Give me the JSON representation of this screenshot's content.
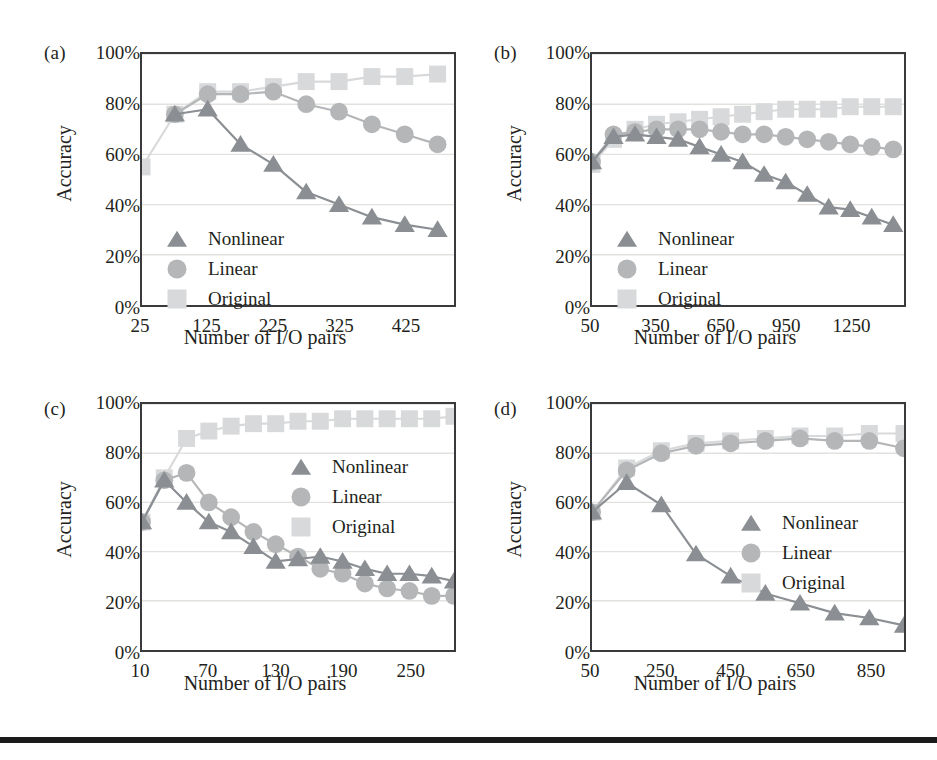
{
  "figure": {
    "panels": [
      "a",
      "b",
      "c",
      "d"
    ],
    "colors": {
      "nonlinear": "#8b8f93",
      "linear": "#b4b6b8",
      "original": "#d8d9da",
      "axis": "#3a3a3c",
      "grid": "#e3e1de",
      "text": "#231f20",
      "rule": "#1a1a1a"
    },
    "legend_labels": {
      "nonlinear": "Nonlinear",
      "linear": "Linear",
      "original": "Original"
    },
    "icons": {
      "nonlinear": "triangle-marker-icon",
      "linear": "circle-marker-icon",
      "original": "square-marker-icon"
    }
  },
  "panel_a": {
    "label": "(a)",
    "ylabel": "Accuracy",
    "xlabel": "Number of I/O pairs"
  },
  "panel_b": {
    "label": "(b)",
    "ylabel": "Accuracy",
    "xlabel": "Number of I/O pairs"
  },
  "panel_c": {
    "label": "(c)",
    "ylabel": "Accuracy",
    "xlabel": "Number of I/O pairs"
  },
  "panel_d": {
    "label": "(d)",
    "ylabel": "Accuracy",
    "xlabel": "Number of I/O pairs"
  },
  "chart_data": [
    {
      "id": "a",
      "type": "line",
      "title": "(a)",
      "xlabel": "Number of I/O pairs",
      "ylabel": "Accuracy",
      "ylim": [
        0,
        100
      ],
      "yticks": [
        0,
        20,
        40,
        60,
        80,
        100
      ],
      "ytick_labels": [
        "0%",
        "20%",
        "40%",
        "60%",
        "80%",
        "100%"
      ],
      "xlim": [
        25,
        500
      ],
      "xticks": [
        25,
        125,
        225,
        325,
        425
      ],
      "xtick_labels": [
        "25",
        "125",
        "225",
        "325",
        "425"
      ],
      "grid": true,
      "legend_position": "inside-left-lower",
      "x": [
        25,
        75,
        125,
        175,
        225,
        275,
        325,
        375,
        425,
        475
      ],
      "series": [
        {
          "name": "Nonlinear",
          "marker": "triangle",
          "color": "#8b8f93",
          "values": [
            null,
            76,
            78,
            64,
            56,
            45,
            40,
            35,
            32,
            30
          ]
        },
        {
          "name": "Linear",
          "marker": "circle",
          "color": "#b4b6b8",
          "values": [
            null,
            76,
            84,
            84,
            85,
            80,
            77,
            72,
            68,
            64
          ]
        },
        {
          "name": "Original",
          "marker": "square",
          "color": "#d8d9da",
          "values": [
            55,
            76,
            85,
            85,
            87,
            89,
            89,
            91,
            91,
            92
          ]
        }
      ]
    },
    {
      "id": "b",
      "type": "line",
      "title": "(b)",
      "xlabel": "Number of I/O pairs",
      "ylabel": "Accuracy",
      "ylim": [
        0,
        100
      ],
      "yticks": [
        0,
        20,
        40,
        60,
        80,
        100
      ],
      "ytick_labels": [
        "0%",
        "20%",
        "40%",
        "60%",
        "80%",
        "100%"
      ],
      "xlim": [
        50,
        1500
      ],
      "xticks": [
        50,
        350,
        650,
        950,
        1250
      ],
      "xtick_labels": [
        "50",
        "350",
        "650",
        "950",
        "1250"
      ],
      "grid": true,
      "legend_position": "inside-left-lower",
      "x": [
        50,
        150,
        250,
        350,
        450,
        550,
        650,
        750,
        850,
        950,
        1050,
        1150,
        1250,
        1350,
        1450
      ],
      "series": [
        {
          "name": "Nonlinear",
          "marker": "triangle",
          "color": "#8b8f93",
          "values": [
            57,
            67,
            68,
            67,
            66,
            63,
            60,
            57,
            52,
            49,
            44,
            39,
            38,
            35,
            32
          ]
        },
        {
          "name": "Linear",
          "marker": "circle",
          "color": "#b4b6b8",
          "values": [
            57,
            68,
            69,
            70,
            70,
            70,
            69,
            68,
            68,
            67,
            66,
            65,
            64,
            63,
            62
          ]
        },
        {
          "name": "Original",
          "marker": "square",
          "color": "#d8d9da",
          "values": [
            56,
            66,
            70,
            72,
            73,
            74,
            75,
            76,
            77,
            78,
            78,
            78,
            79,
            79,
            79
          ]
        }
      ]
    },
    {
      "id": "c",
      "type": "line",
      "title": "(c)",
      "xlabel": "Number of I/O pairs",
      "ylabel": "Accuracy",
      "ylim": [
        0,
        100
      ],
      "yticks": [
        0,
        20,
        40,
        60,
        80,
        100
      ],
      "ytick_labels": [
        "0%",
        "20%",
        "40%",
        "60%",
        "80%",
        "100%"
      ],
      "xlim": [
        10,
        290
      ],
      "xticks": [
        10,
        70,
        130,
        190,
        250
      ],
      "xtick_labels": [
        "10",
        "70",
        "130",
        "190",
        "250"
      ],
      "grid": true,
      "legend_position": "inside-right-upper",
      "x": [
        10,
        30,
        50,
        70,
        90,
        110,
        130,
        150,
        170,
        190,
        210,
        230,
        250,
        270,
        290
      ],
      "series": [
        {
          "name": "Nonlinear",
          "marker": "triangle",
          "color": "#8b8f93",
          "values": [
            52,
            69,
            60,
            52,
            48,
            42,
            36,
            37,
            38,
            36,
            33,
            31,
            31,
            30,
            28
          ]
        },
        {
          "name": "Linear",
          "marker": "circle",
          "color": "#b4b6b8",
          "values": [
            52,
            69,
            72,
            60,
            54,
            48,
            43,
            38,
            33,
            31,
            27,
            25,
            24,
            22,
            22
          ]
        },
        {
          "name": "Original",
          "marker": "square",
          "color": "#d8d9da",
          "values": [
            52,
            70,
            86,
            89,
            91,
            92,
            92,
            93,
            93,
            94,
            94,
            94,
            94,
            94,
            95
          ]
        }
      ]
    },
    {
      "id": "d",
      "type": "line",
      "title": "(d)",
      "xlabel": "Number of I/O pairs",
      "ylabel": "Accuracy",
      "ylim": [
        0,
        100
      ],
      "yticks": [
        0,
        20,
        40,
        60,
        80,
        100
      ],
      "ytick_labels": [
        "0%",
        "20%",
        "40%",
        "60%",
        "80%",
        "100%"
      ],
      "xlim": [
        50,
        950
      ],
      "xticks": [
        50,
        250,
        450,
        650,
        850
      ],
      "xtick_labels": [
        "50",
        "250",
        "450",
        "650",
        "850"
      ],
      "grid": true,
      "legend_position": "inside-right-middle",
      "x": [
        50,
        150,
        250,
        350,
        450,
        550,
        650,
        750,
        850,
        950
      ],
      "series": [
        {
          "name": "Nonlinear",
          "marker": "triangle",
          "color": "#8b8f93",
          "values": [
            56,
            68,
            59,
            39,
            30,
            23,
            19,
            15,
            13,
            10
          ]
        },
        {
          "name": "Linear",
          "marker": "circle",
          "color": "#b4b6b8",
          "values": [
            56,
            73,
            80,
            83,
            84,
            85,
            86,
            85,
            85,
            82
          ]
        },
        {
          "name": "Original",
          "marker": "square",
          "color": "#d8d9da",
          "values": [
            56,
            74,
            81,
            84,
            85,
            86,
            87,
            87,
            88,
            88
          ]
        }
      ]
    }
  ]
}
